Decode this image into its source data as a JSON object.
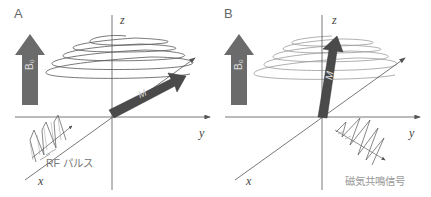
{
  "panels": [
    {
      "id": "A",
      "label": "A",
      "axes": {
        "x": "x",
        "y": "y",
        "z": "z"
      },
      "field_label": "B₀",
      "vector_label": "M",
      "pulse_label": "RF パルス"
    },
    {
      "id": "B",
      "label": "B",
      "axes": {
        "x": "x",
        "y": "y",
        "z": "z"
      },
      "field_label": "B₀",
      "vector_label": "M",
      "signal_label": "磁気共鳴信号"
    }
  ],
  "colors": {
    "field_arrow": "#6b6b6b",
    "vector_arrow": "#4a4a4a",
    "axis_line": "#555555",
    "spiral_A": "#555555",
    "spiral_B": "#9a9a9a"
  }
}
